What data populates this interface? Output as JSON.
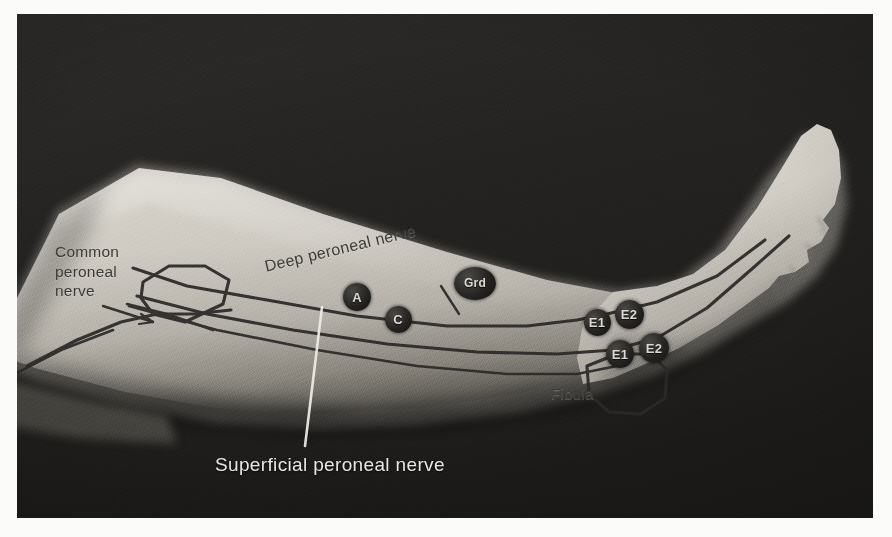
{
  "figure": {
    "type": "anatomical-photograph",
    "modality": "grayscale clinical photograph with nerve-conduction overlay",
    "colors": {
      "background_dark": "#262523",
      "skin_light": "#c9c5bd",
      "skin_shadow": "#6f6b63",
      "overlay_line": "#2b2a28",
      "marker_fill": "#201f1d",
      "marker_text": "#ddd9d2",
      "light_label_text": "#e8e6e1",
      "dark_label_text": "#3b3b39",
      "page": "#fbfbfa"
    },
    "labels": [
      {
        "id": "common-peroneal-nerve",
        "text": "Common\nperoneal\nnerve",
        "style": "dark",
        "leader": "arrow pointing right to fibular head"
      },
      {
        "id": "deep-peroneal-nerve",
        "text": "Deep peroneal nerve",
        "style": "dark",
        "rotation_deg": -13.5,
        "leader": "short diagonal tick to nerve"
      },
      {
        "id": "fibula",
        "text": "Fibula",
        "style": "dark",
        "leader": "none"
      },
      {
        "id": "superficial-peroneal-nerve",
        "text": "Superficial peroneal nerve",
        "style": "light",
        "leader": "white vertical line to nerve"
      }
    ],
    "electrodes": [
      {
        "id": "marker-a",
        "label": "A",
        "shape": "circle",
        "x": 357,
        "y": 297,
        "d": 28,
        "meaning": "active stimulation site"
      },
      {
        "id": "marker-c",
        "label": "C",
        "shape": "circle",
        "x": 398,
        "y": 319,
        "d": 27,
        "meaning": "cathode / reference"
      },
      {
        "id": "marker-grd",
        "label": "Grd",
        "shape": "ellipse",
        "x": 475,
        "y": 283,
        "w": 42,
        "h": 33,
        "meaning": "ground electrode"
      },
      {
        "id": "marker-e1-upper",
        "label": "E1",
        "shape": "circle",
        "x": 597,
        "y": 322,
        "d": 27,
        "meaning": "recording electrode 1 (proximal pair)"
      },
      {
        "id": "marker-e2-upper",
        "label": "E2",
        "shape": "circle",
        "x": 629,
        "y": 314,
        "d": 29,
        "meaning": "recording electrode 2 (proximal pair)"
      },
      {
        "id": "marker-e1-lower",
        "label": "E1",
        "shape": "circle",
        "x": 620,
        "y": 354,
        "d": 28,
        "meaning": "recording electrode 1 (distal pair)"
      },
      {
        "id": "marker-e2-lower",
        "label": "E2",
        "shape": "circle",
        "x": 654,
        "y": 348,
        "d": 30,
        "meaning": "recording electrode 2 (distal pair)"
      }
    ],
    "overlay_structures": [
      "common peroneal nerve trunk descending behind the fibular head",
      "fibular head outline (polygon at knee)",
      "deep peroneal nerve running distally toward the ankle and dorsum of foot",
      "superficial peroneal nerve running distally, lateral to the deep branch",
      "fibular shaft line labelled Fibula",
      "lateral malleolus outline at the ankle"
    ]
  }
}
